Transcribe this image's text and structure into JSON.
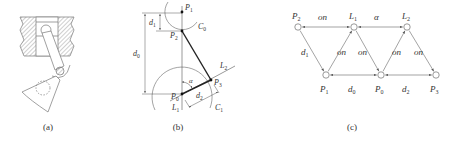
{
  "figure": {
    "panels": [
      {
        "id": "a",
        "caption": "(a)",
        "description": "Piston and crank mechanism drawing"
      },
      {
        "id": "b",
        "caption": "(b)",
        "points": [
          {
            "name": "P",
            "sub": "1"
          },
          {
            "name": "P",
            "sub": "2"
          },
          {
            "name": "P",
            "sub": "0"
          },
          {
            "name": "P",
            "sub": "3"
          }
        ],
        "circles": [
          {
            "name": "C",
            "sub": "0"
          },
          {
            "name": "C",
            "sub": "1"
          }
        ],
        "lines": [
          {
            "name": "L",
            "sub": "1"
          },
          {
            "name": "L",
            "sub": "2"
          }
        ],
        "dimensions": [
          {
            "name": "d",
            "sub": "0"
          },
          {
            "name": "d",
            "sub": "1"
          },
          {
            "name": "d",
            "sub": "2"
          }
        ],
        "angle": "α"
      },
      {
        "id": "c",
        "caption": "(c)",
        "nodes": [
          {
            "id": "P2",
            "name": "P",
            "sub": "2"
          },
          {
            "id": "L1",
            "name": "L",
            "sub": "1"
          },
          {
            "id": "L2",
            "name": "L",
            "sub": "2"
          },
          {
            "id": "P1",
            "name": "P",
            "sub": "1"
          },
          {
            "id": "P0",
            "name": "P",
            "sub": "0"
          },
          {
            "id": "P3",
            "name": "P",
            "sub": "3"
          }
        ],
        "edges": [
          {
            "from": "P2",
            "to": "L1",
            "label": "on",
            "arrows": "both"
          },
          {
            "from": "L1",
            "to": "L2",
            "label": "α",
            "arrows": "both"
          },
          {
            "from": "P2",
            "to": "P1",
            "label": "d",
            "label_sub": "1",
            "arrows": "end"
          },
          {
            "from": "P1",
            "to": "L1",
            "label": "on",
            "arrows": "end"
          },
          {
            "from": "L1",
            "to": "P0",
            "label": "on",
            "arrows": "end"
          },
          {
            "from": "P0",
            "to": "L2",
            "label": "on",
            "arrows": "end"
          },
          {
            "from": "L2",
            "to": "P3",
            "label": "on",
            "arrows": "end"
          },
          {
            "from": "P1",
            "to": "P0",
            "label": "d",
            "label_sub": "0",
            "arrows": "both"
          },
          {
            "from": "P0",
            "to": "P3",
            "label": "d",
            "label_sub": "2",
            "arrows": "both"
          }
        ]
      }
    ]
  }
}
